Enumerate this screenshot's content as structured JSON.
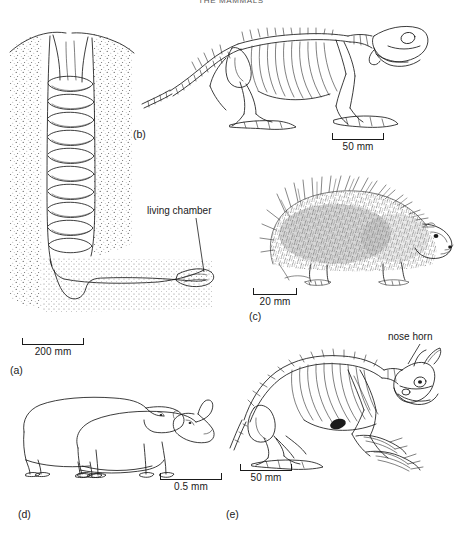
{
  "page": {
    "running_head": "THE MAMMALS",
    "background_color": "#ffffff",
    "ink_color": "#1a1a1a"
  },
  "panels": [
    {
      "id": "a",
      "label": "(a)",
      "subject": "corkscrew burrow (Daemonelix) in cross-section",
      "description": "Vertical helical spiral shaft descending from ground surface, turning into a horizontal basal tunnel that ends in an enlarged living chamber; surrounding sediment shown with stipple.",
      "annotation": "living chamber",
      "scale": {
        "value": "200",
        "unit": "mm",
        "text": "200 mm"
      }
    },
    {
      "id": "b",
      "label": "(b)",
      "subject": "fossil beaver skeleton, lateral view facing right",
      "description": "Line drawing of a rodent skeleton with long tail, robust forelimbs and skull with enlarged incisors.",
      "scale": {
        "value": "50",
        "unit": "mm",
        "text": "50 mm"
      }
    },
    {
      "id": "c",
      "label": "(c)",
      "subject": "porcupine, lateral view facing right",
      "description": "Stippled and hatched drawing of a spiny rodent with dense quills over back and rump.",
      "scale": {
        "value": "20",
        "unit": "mm",
        "text": "20 mm"
      }
    },
    {
      "id": "d",
      "label": "(d)",
      "subject": "two rhinoceros body outlines, lateral view facing right",
      "description": "Overlapping silhouette outlines; the rear animal hornless, the front animal bearing a nasal horn.",
      "scale": {
        "value": "0.5",
        "unit": "mm",
        "text": "0.5 mm"
      }
    },
    {
      "id": "e",
      "label": "(e)",
      "subject": "horned digging mammal skeleton, lateral view facing right",
      "description": "Skeleton in crouching posture with heavy clawed forelimbs and a broad skull bearing paired nasal horns.",
      "annotation": "nose horn",
      "scale": {
        "value": "50",
        "unit": "mm",
        "text": "50 mm"
      }
    }
  ]
}
